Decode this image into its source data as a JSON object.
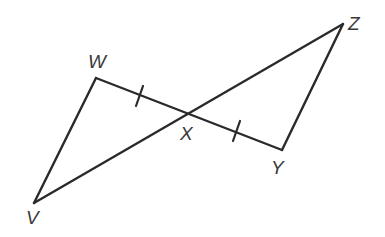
{
  "diagram": {
    "type": "geometry",
    "stroke_color": "#2a2a2a",
    "label_color": "#3a3a3a",
    "points": {
      "W": {
        "label": "W",
        "x": 96,
        "y": 78
      },
      "X": {
        "label": "X",
        "x": 188,
        "y": 114
      },
      "Y": {
        "label": "Y",
        "x": 282,
        "y": 150
      },
      "Z": {
        "label": "Z",
        "x": 343,
        "y": 24
      },
      "V": {
        "label": "V",
        "x": 34,
        "y": 203
      }
    },
    "segments": [
      {
        "from": "W",
        "to": "Y"
      },
      {
        "from": "V",
        "to": "Z"
      },
      {
        "from": "W",
        "to": "V"
      },
      {
        "from": "Y",
        "to": "Z"
      }
    ],
    "tick_marks": [
      {
        "segment": "WX",
        "count": 1
      },
      {
        "segment": "XY",
        "count": 1
      }
    ]
  }
}
